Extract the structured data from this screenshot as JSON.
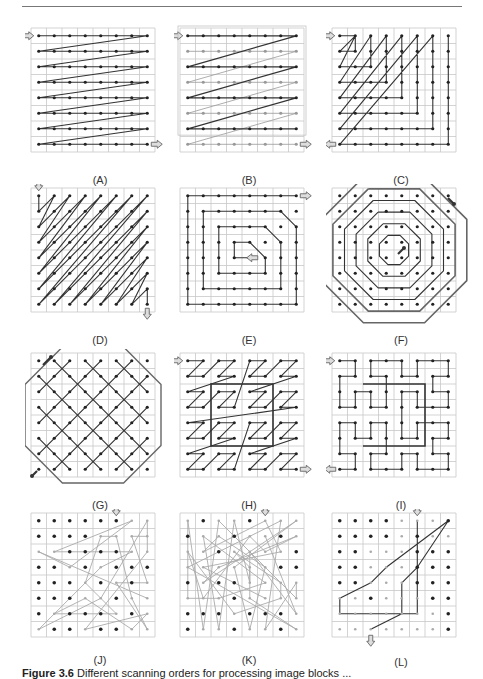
{
  "figure": {
    "caption_label": "Figure 3.6",
    "caption_text": "Different scanning orders for processing image blocks ..."
  },
  "grid": {
    "rows": 8,
    "cols": 8,
    "cell_px": 15.5,
    "line_color": "#c8c8c8",
    "point_color": "#222222",
    "path_color": "#333333",
    "faint_color": "#999999"
  },
  "panels": [
    {
      "id": "A",
      "label": "(A)",
      "name": "raster-scan",
      "x": 31,
      "y": 27
    },
    {
      "id": "B",
      "label": "(B)",
      "name": "interlaced-raster-scan",
      "x": 180,
      "y": 27
    },
    {
      "id": "C",
      "label": "(C)",
      "name": "diagonal-corner-scan",
      "x": 332,
      "y": 27
    },
    {
      "id": "D",
      "label": "(D)",
      "name": "diagonal-zigzag-scan",
      "x": 31,
      "y": 187
    },
    {
      "id": "E",
      "label": "(E)",
      "name": "spiral-scan",
      "x": 180,
      "y": 187
    },
    {
      "id": "F",
      "label": "(F)",
      "name": "octagonal-spiral-scan",
      "x": 332,
      "y": 187
    },
    {
      "id": "G",
      "label": "(G)",
      "name": "diagonal-lattice-scan",
      "x": 31,
      "y": 352
    },
    {
      "id": "H",
      "label": "(H)",
      "name": "z-order-scan",
      "x": 180,
      "y": 352
    },
    {
      "id": "I",
      "label": "(I)",
      "name": "hilbert-curve-scan",
      "x": 332,
      "y": 352
    },
    {
      "id": "J",
      "label": "(J)",
      "name": "random-scan-partial",
      "x": 31,
      "y": 512
    },
    {
      "id": "K",
      "label": "(K)",
      "name": "random-scan-dense",
      "x": 180,
      "y": 512
    },
    {
      "id": "L",
      "label": "(L)",
      "name": "random-scan-sparse",
      "x": 332,
      "y": 512
    }
  ]
}
